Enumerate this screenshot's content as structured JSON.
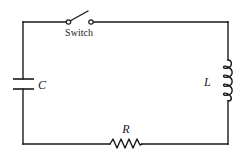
{
  "diagram": {
    "type": "RLC series circuit",
    "colors": {
      "line": "#1a1a1a",
      "background": "#ffffff"
    },
    "components": {
      "switch": {
        "label": "Switch",
        "state": "open"
      },
      "capacitor": {
        "label": "C"
      },
      "inductor": {
        "label": "L"
      },
      "resistor": {
        "label": "R"
      }
    }
  }
}
